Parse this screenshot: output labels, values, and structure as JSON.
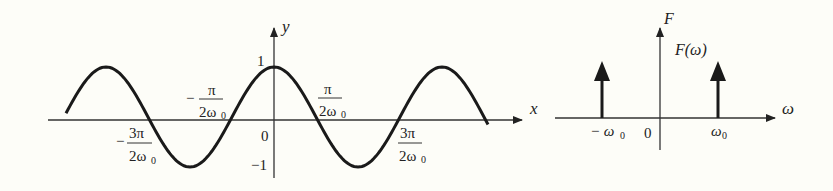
{
  "left_plot": {
    "title": "cosine signal",
    "x_axis_label": "x",
    "y_axis_label": "y",
    "y_tick_top": "1",
    "y_tick_bottom": "−1",
    "origin_label": "0",
    "labels": {
      "neg_3pi_num": "3π",
      "neg_3pi_den": "2ω",
      "neg_pi_num": "π",
      "neg_pi_den": "2ω",
      "pos_pi_num": "π",
      "pos_pi_den": "2ω",
      "pos_3pi_num": "3π",
      "pos_3pi_den": "2ω",
      "sub": "0",
      "minus": "−"
    }
  },
  "right_plot": {
    "title": "Fourier transform impulses",
    "y_axis_label": "F",
    "function_label": "F(ω)",
    "x_axis_label": "ω",
    "origin_label": "0",
    "neg_impulse_label": "− ω",
    "pos_impulse_label": "ω",
    "sub": "0"
  },
  "colors": {
    "ink": "#1a1a1a",
    "background": "#fdfdf8"
  }
}
